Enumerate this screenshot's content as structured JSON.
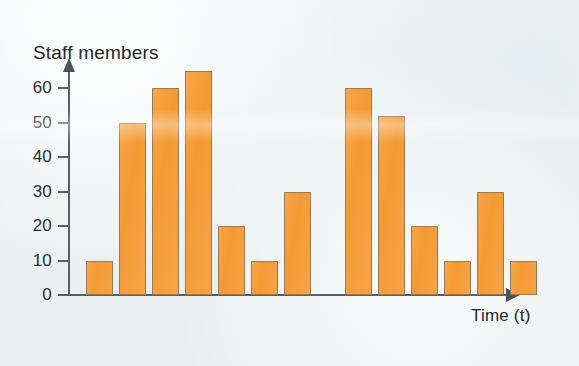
{
  "chart_data": {
    "type": "bar",
    "title": "",
    "ylabel": "Staff members",
    "xlabel": "Time (t)",
    "ylim": [
      0,
      68
    ],
    "y_ticks": [
      0,
      10,
      20,
      30,
      40,
      50,
      60
    ],
    "y_tick_labels": [
      "0",
      "10",
      "20",
      "30",
      "40",
      "50",
      "60"
    ],
    "x_ticks": [],
    "x_tick_labels": [],
    "grid": false,
    "legend": null,
    "categories": [
      "1",
      "2",
      "3",
      "4",
      "5",
      "6",
      "7",
      "8",
      "9",
      "10",
      "11",
      "12",
      "13"
    ],
    "values": [
      10,
      50,
      60,
      65,
      20,
      10,
      30,
      60,
      52,
      20,
      10,
      30,
      10
    ],
    "groups": [
      {
        "name": "first-period",
        "values": [
          10,
          50,
          60,
          65,
          20,
          10,
          30
        ]
      },
      {
        "name": "second-period",
        "values": [
          60,
          52,
          20,
          10,
          30,
          10
        ]
      }
    ],
    "bar_color": "#f49a33",
    "bar_edge_color": "#9a7b55",
    "axis_color": "#5a5f63",
    "background_color": "#eef3f4",
    "annotations": []
  },
  "axes": {
    "y_axis_arrow_icon": "arrow-up-icon",
    "x_axis_arrow_icon": "arrow-right-icon"
  }
}
